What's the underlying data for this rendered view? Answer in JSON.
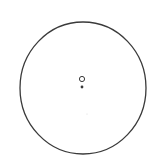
{
  "diagram": {
    "background": "#ffffff",
    "stroke_color": "#3a3a3a",
    "outer_circle": {
      "cx": 83,
      "cy": 88,
      "rx": 63,
      "ry": 66,
      "stroke_width": 1.3
    },
    "hollow_marker": {
      "cx": 82,
      "cy": 79,
      "r": 2.6,
      "stroke_width": 1
    },
    "filled_dot": {
      "cx": 82,
      "cy": 87,
      "r": 1.4
    },
    "faint_dot": {
      "cx": 87,
      "cy": 114,
      "r": 0.6,
      "color": "#d8d8d8"
    }
  }
}
